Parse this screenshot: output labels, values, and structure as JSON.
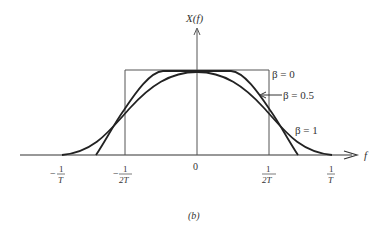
{
  "figure": {
    "y_axis_label": "X(f)",
    "x_axis_label": "f",
    "caption": "(b)",
    "ticks": [
      {
        "id": "neg_1_T",
        "sign": "−",
        "num": "1",
        "den": "T"
      },
      {
        "id": "neg_1_2T",
        "sign": "−",
        "num": "1",
        "den": "2T"
      },
      {
        "id": "zero",
        "label": "0"
      },
      {
        "id": "pos_1_2T",
        "num": "1",
        "den": "2T"
      },
      {
        "id": "pos_1_T",
        "num": "1",
        "den": "T"
      }
    ],
    "curves": [
      {
        "name": "beta-0",
        "label": "β = 0",
        "shape": "rectangle"
      },
      {
        "name": "beta-0.5",
        "label": "β = 0.5",
        "shape": "raised-cosine"
      },
      {
        "name": "beta-1",
        "label": "β = 1",
        "shape": "raised-cosine"
      }
    ],
    "line_color": "#222222"
  }
}
